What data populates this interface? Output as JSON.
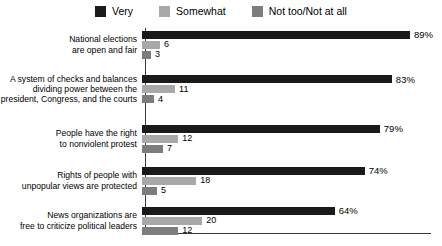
{
  "legend": {
    "position": "top-center",
    "items": [
      {
        "label": "Very",
        "color": "#1a1a1a",
        "swatch_name": "legend-swatch-very"
      },
      {
        "label": "Somewhat",
        "color": "#a8a8a8",
        "swatch_name": "legend-swatch-somewhat"
      },
      {
        "label": "Not too/Not at all",
        "color": "#7d7d7d",
        "swatch_name": "legend-swatch-not-too"
      }
    ]
  },
  "chart_data": {
    "type": "bar",
    "orientation": "horizontal",
    "title": "",
    "subtitle": "",
    "xlabel": "",
    "ylabel": "",
    "grid": false,
    "legend_position": "top-center",
    "xlim": [
      0,
      95
    ],
    "value_suffix_first_series": "%",
    "categories": [
      "National elections are open and fair",
      "A system of checks and balances dividing power between the president, Congress, and the courts",
      "People have the right to nonviolent protest",
      "Rights of people with unpopular views are protected",
      "News organizations are free to criticize political leaders"
    ],
    "category_lines": [
      [
        "National elections",
        "are open and fair"
      ],
      [
        "A system of checks and balances",
        "dividing power between the",
        "president, Congress, and the courts"
      ],
      [
        "People have the right",
        "to nonviolent protest"
      ],
      [
        "Rights of people with",
        "unpopular views are protected"
      ],
      [
        "News organizations are",
        "free to criticize political leaders"
      ]
    ],
    "series": [
      {
        "name": "Very",
        "color": "#1a1a1a",
        "values": [
          89,
          83,
          79,
          74,
          64
        ],
        "labels": [
          "89%",
          "83%",
          "79%",
          "74%",
          "64%"
        ]
      },
      {
        "name": "Somewhat",
        "color": "#a8a8a8",
        "values": [
          6,
          11,
          12,
          18,
          20
        ],
        "labels": [
          "6",
          "11",
          "12",
          "18",
          "20"
        ]
      },
      {
        "name": "Not too/Not at all",
        "color": "#7d7d7d",
        "values": [
          3,
          4,
          7,
          5,
          12
        ],
        "labels": [
          "3",
          "4",
          "7",
          "5",
          "12"
        ]
      }
    ]
  }
}
